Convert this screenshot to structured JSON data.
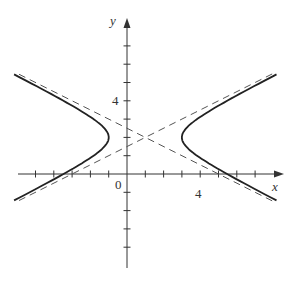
{
  "chart_data": {
    "type": "line",
    "title": "",
    "xlabel": "x",
    "ylabel": "y",
    "xlim": [
      -6,
      8.5
    ],
    "ylim": [
      -5,
      8.4
    ],
    "grid": false,
    "tick_step": 1,
    "tick_labels": {
      "x": [
        "0",
        "4"
      ],
      "y": [
        "4"
      ]
    },
    "series": [
      {
        "name": "hyperbola",
        "equation": "(x-1)^2/4 - (y-2)^2 = 1",
        "center": [
          1,
          2
        ],
        "vertices": [
          [
            -1,
            2
          ],
          [
            3,
            2
          ]
        ],
        "style": "solid"
      },
      {
        "name": "asymptote-1",
        "equation": "y = 2 + (x-1)/2",
        "style": "dashed"
      },
      {
        "name": "asymptote-2",
        "equation": "y = 2 - (x-1)/2",
        "style": "dashed"
      }
    ]
  },
  "labels": {
    "x_axis": "x",
    "y_axis": "y",
    "origin": "0",
    "x_tick_4": "4",
    "y_tick_4": "4"
  }
}
